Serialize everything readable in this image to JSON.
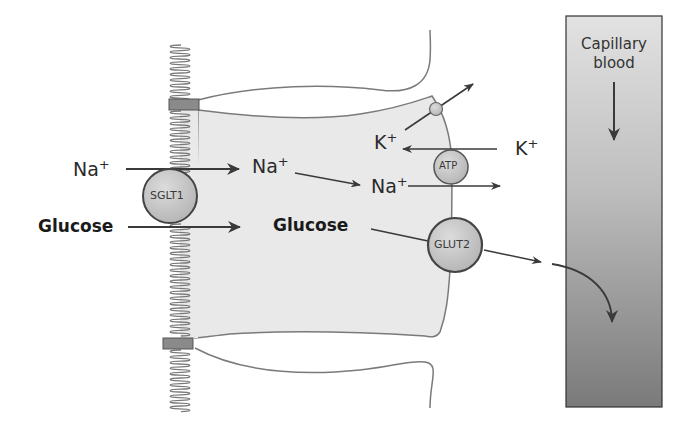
{
  "figure": {
    "type": "diagram",
    "colors": {
      "cell_fill": "#e8e8e8",
      "outline": "#6e6e6e",
      "arrow": "#3a3a3a",
      "transporter_fill": "#c9c9c9",
      "tight_junction": "#8a8a8a",
      "capillary_top": "#dedede",
      "capillary_bottom": "#7c7c7c"
    }
  },
  "labels": {
    "na_lumen": {
      "base": "Na",
      "charge": "+"
    },
    "na_cell": {
      "base": "Na",
      "charge": "+"
    },
    "na_exit": {
      "base": "Na",
      "charge": "+"
    },
    "k_cell": {
      "base": "K",
      "charge": "+"
    },
    "k_blood": {
      "base": "K",
      "charge": "+"
    },
    "glucose_lumen": "Glucose",
    "glucose_cell": "Glucose"
  },
  "transporters": {
    "sglt1": "SGLT1",
    "atp": "ATP",
    "glut2": "GLUT2"
  },
  "capillary": {
    "line1": "Capillary",
    "line2": "blood"
  }
}
